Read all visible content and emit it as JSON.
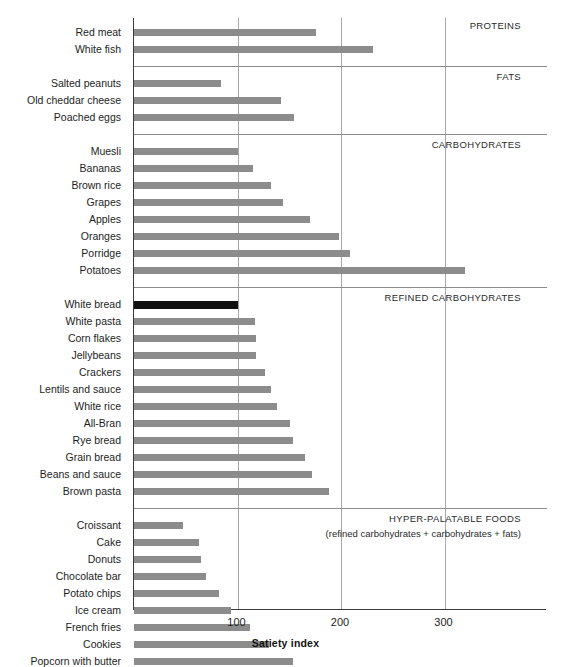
{
  "chart_data": {
    "type": "bar",
    "orientation": "horizontal",
    "title": "",
    "xlabel": "Satiety index",
    "ylabel": "",
    "xlim": [
      0,
      399
    ],
    "xticks": [
      100,
      200,
      300
    ],
    "grid": "vertical",
    "legend": "none",
    "reference_item": "White bread",
    "reference_value": 100,
    "categories": [
      "Red meat",
      "White fish",
      "Salted peanuts",
      "Old cheddar cheese",
      "Poached eggs",
      "Muesli",
      "Bananas",
      "Brown rice",
      "Grapes",
      "Apples",
      "Oranges",
      "Porridge",
      "Potatoes",
      "White bread",
      "White pasta",
      "Corn flakes",
      "Jellybeans",
      "Crackers",
      "Lentils and sauce",
      "White rice",
      "All-Bran",
      "Rye bread",
      "Grain bread",
      "Beans and sauce",
      "Brown pasta",
      "Croissant",
      "Cake",
      "Donuts",
      "Chocolate bar",
      "Potato chips",
      "Ice cream",
      "French fries",
      "Cookies",
      "Popcorn with butter"
    ],
    "values": [
      176,
      231,
      84,
      142,
      155,
      100,
      115,
      132,
      144,
      170,
      198,
      209,
      320,
      100,
      117,
      118,
      118,
      127,
      132,
      138,
      151,
      154,
      165,
      172,
      188,
      47,
      63,
      65,
      70,
      82,
      94,
      112,
      130,
      154
    ],
    "groups": [
      {
        "label": "PROTEINS",
        "sublabel": "",
        "items": [
          {
            "name": "Red meat",
            "value": 176
          },
          {
            "name": "White fish",
            "value": 231
          }
        ]
      },
      {
        "label": "FATS",
        "sublabel": "",
        "items": [
          {
            "name": "Salted peanuts",
            "value": 84
          },
          {
            "name": "Old cheddar cheese",
            "value": 142
          },
          {
            "name": "Poached eggs",
            "value": 155
          }
        ]
      },
      {
        "label": "CARBOHYDRATES",
        "sublabel": "",
        "items": [
          {
            "name": "Muesli",
            "value": 100
          },
          {
            "name": "Bananas",
            "value": 115
          },
          {
            "name": "Brown rice",
            "value": 132
          },
          {
            "name": "Grapes",
            "value": 144
          },
          {
            "name": "Apples",
            "value": 170
          },
          {
            "name": "Oranges",
            "value": 198
          },
          {
            "name": "Porridge",
            "value": 209
          },
          {
            "name": "Potatoes",
            "value": 320
          }
        ]
      },
      {
        "label": "REFINED CARBOHYDRATES",
        "sublabel": "",
        "items": [
          {
            "name": "White bread",
            "value": 100,
            "highlight": true
          },
          {
            "name": "White pasta",
            "value": 117
          },
          {
            "name": "Corn flakes",
            "value": 118
          },
          {
            "name": "Jellybeans",
            "value": 118
          },
          {
            "name": "Crackers",
            "value": 127
          },
          {
            "name": "Lentils and sauce",
            "value": 132
          },
          {
            "name": "White rice",
            "value": 138
          },
          {
            "name": "All-Bran",
            "value": 151
          },
          {
            "name": "Rye bread",
            "value": 154
          },
          {
            "name": "Grain bread",
            "value": 165
          },
          {
            "name": "Beans and sauce",
            "value": 172
          },
          {
            "name": "Brown pasta",
            "value": 188
          }
        ]
      },
      {
        "label": "HYPER-PALATABLE FOODS",
        "sublabel": "(refined carbohydrates + carbohydrates + fats)",
        "items": [
          {
            "name": "Croissant",
            "value": 47
          },
          {
            "name": "Cake",
            "value": 63
          },
          {
            "name": "Donuts",
            "value": 65
          },
          {
            "name": "Chocolate bar",
            "value": 70
          },
          {
            "name": "Potato chips",
            "value": 82
          },
          {
            "name": "Ice cream",
            "value": 94
          },
          {
            "name": "French fries",
            "value": 112
          },
          {
            "name": "Cookies",
            "value": 130
          },
          {
            "name": "Popcorn with butter",
            "value": 154
          }
        ]
      }
    ],
    "colors": {
      "bar": "#8c8c8c",
      "highlight_bar": "#111111",
      "axis": "#3a3a3a",
      "gridline": "#a8a8a8",
      "separator": "#8d8d8d",
      "text": "#1d1d1d",
      "background": "#ffffff"
    }
  }
}
